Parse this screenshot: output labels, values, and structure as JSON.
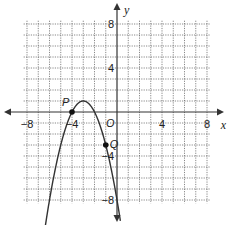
{
  "chart_data": {
    "type": "line",
    "title": "",
    "xlabel": "x",
    "ylabel": "y",
    "origin_label": "O",
    "xlim": [
      -8,
      8
    ],
    "ylim": [
      -8,
      8
    ],
    "grid": true,
    "grid_step": 1,
    "x_ticks": [
      {
        "value": -8,
        "label": "−8"
      },
      {
        "value": -4,
        "label": "−4"
      },
      {
        "value": 4,
        "label": "4"
      },
      {
        "value": 8,
        "label": "8"
      }
    ],
    "y_ticks": [
      {
        "value": 8,
        "label": "8"
      },
      {
        "value": 4,
        "label": "4"
      },
      {
        "value": -4,
        "label": "−4"
      },
      {
        "value": -8,
        "label": "−8"
      }
    ],
    "series": [
      {
        "name": "parabola",
        "equation": "y = -(x+3)^2 + 1",
        "vertex": [
          -3,
          1
        ],
        "x_range": [
          -6.4,
          0.3
        ]
      }
    ],
    "points": [
      {
        "label": "P",
        "x": -4,
        "y": 0
      },
      {
        "label": "Q",
        "x": -1,
        "y": -3
      }
    ]
  }
}
